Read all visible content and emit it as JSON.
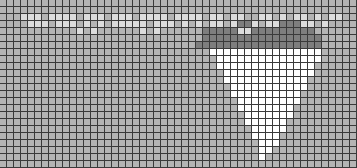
{
  "board": {
    "cols": 51,
    "rows": 24,
    "cell_size": 7
  },
  "colors": {
    "base": "#b4b4b4",
    "light": "#dcdcdc",
    "dark": "#7e7e7e",
    "white": "#ffffff",
    "grid_line": "#3a3a3a"
  },
  "rows": [
    "...................................................",
    "...................................................",
    "...lll.llll.lll.lll.llll.llll.ll.ll..ll.l.ll.l.ll..",
    "....lll.lll.l.l.lllll.lll.l.l.ll.lddl.lldddll.l....",
    "...........l.l......l.l......dddddllddddddddd......",
    ".............................ddddddddddddddddd.....",
    "............................dddddddddddddddddd.....",
    "..............................wwwwwwwwwwwwwwww.....",
    "...............................wwwwwwwwwwwwwww.....",
    "...............................wwwwwwwwwwwwww......",
    "................................wwwwwwwwwwwww......",
    "................................wwwwwwwwwwww.......",
    ".................................wwwwwwwwwww.......",
    ".................................wwwwwwwwww........",
    "..................................wwwwwwwww........",
    "..................................wwwwwwww.........",
    "...................................wwwwwww.........",
    "...................................wwwwww..........",
    "....................................wwwww..........",
    "....................................wwww...........",
    ".....................................www...........",
    ".....................................ww............",
    ".....................................w.............",
    "..................................................."
  ]
}
